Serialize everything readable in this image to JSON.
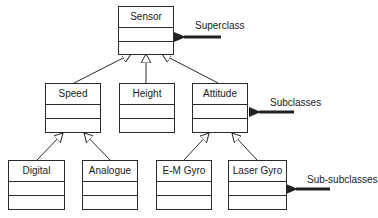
{
  "diagram": {
    "type": "UML class hierarchy",
    "classes": [
      {
        "id": "sensor",
        "name": "Sensor",
        "level": "superclass"
      },
      {
        "id": "speed",
        "name": "Speed",
        "level": "subclass",
        "parent": "sensor"
      },
      {
        "id": "height",
        "name": "Height",
        "level": "subclass",
        "parent": "sensor"
      },
      {
        "id": "attitude",
        "name": "Attitude",
        "level": "subclass",
        "parent": "sensor"
      },
      {
        "id": "digital",
        "name": "Digital",
        "level": "sub-subclass",
        "parent": "speed"
      },
      {
        "id": "analogue",
        "name": "Analogue",
        "level": "sub-subclass",
        "parent": "speed"
      },
      {
        "id": "emgyro",
        "name": "E-M Gyro",
        "level": "sub-subclass",
        "parent": "attitude"
      },
      {
        "id": "lasergyro",
        "name": "Laser Gyro",
        "level": "sub-subclass",
        "parent": "attitude"
      }
    ],
    "annotations": {
      "superclass": "Superclass",
      "subclasses": "Subclasses",
      "subsubclasses": "Sub-subclasses"
    },
    "colors": {
      "line": "#2a2a2a",
      "arrow": "#222222",
      "background": "#ffffff"
    }
  }
}
